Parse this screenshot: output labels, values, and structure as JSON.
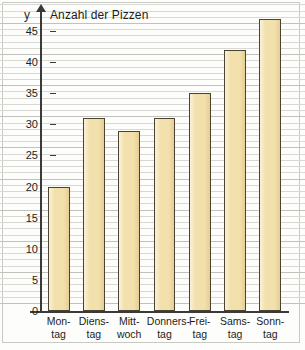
{
  "chart_data": {
    "type": "bar",
    "title": "Anzahl der Pizzen",
    "xlabel": "",
    "ylabel": "y",
    "categories": [
      "Montag",
      "Dienstag",
      "Mittwoch",
      "Donnerstag",
      "Freitag",
      "Samstag",
      "Sonntag"
    ],
    "category_labels": [
      {
        "line1": "Mon-",
        "line2": "tag"
      },
      {
        "line1": "Diens-",
        "line2": "tag"
      },
      {
        "line1": "Mitt-",
        "line2": "woch"
      },
      {
        "line1": "Donners-",
        "line2": "tag"
      },
      {
        "line1": "Frei-",
        "line2": "tag"
      },
      {
        "line1": "Sams-",
        "line2": "tag"
      },
      {
        "line1": "Sonn-",
        "line2": "tag"
      }
    ],
    "values": [
      20,
      31,
      29,
      31,
      35,
      42,
      47
    ],
    "ylim": [
      0,
      48.7
    ],
    "ytick_labels": [
      "0",
      "5",
      "10",
      "15",
      "20",
      "25",
      "30",
      "35",
      "40",
      "45"
    ],
    "ytick_values": [
      0,
      5,
      10,
      15,
      20,
      25,
      30,
      35,
      40,
      45
    ],
    "minor_tick_step": 1,
    "grid": true,
    "legend": "none",
    "bar_fill_color": "#f2dfa8",
    "bar_border_color": "#4a4334",
    "axis_color": "#3a3a38",
    "grid_color": "#d8d8d4",
    "background_color": "#fdfdfc"
  }
}
